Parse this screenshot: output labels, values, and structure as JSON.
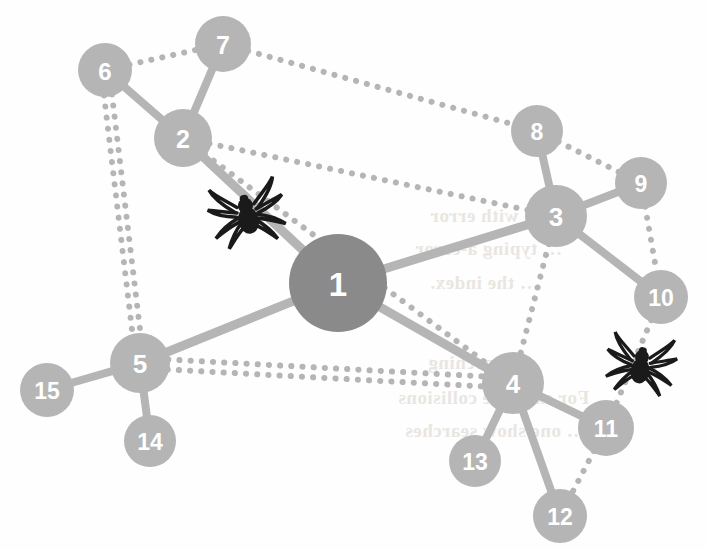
{
  "figure": {
    "type": "network-graph",
    "background_color": "#fefefe",
    "hub_node_color": "#8a8a8a",
    "node_color": "#b5b5b5",
    "edge_color": "#b5b5b5",
    "label_color": "#ffffff",
    "spider_color": "#1a1a1a"
  },
  "nodes": [
    {
      "id": "1",
      "label": "1",
      "x": 338,
      "y": 283,
      "r": 49,
      "kind": "hub",
      "color": "#8a8a8a",
      "font_size": 33
    },
    {
      "id": "2",
      "label": "2",
      "x": 183,
      "y": 138,
      "r": 29,
      "kind": "node",
      "color": "#b5b5b5",
      "font_size": 25
    },
    {
      "id": "3",
      "label": "3",
      "x": 556,
      "y": 216,
      "r": 31,
      "kind": "node",
      "color": "#b5b5b5",
      "font_size": 26
    },
    {
      "id": "4",
      "label": "4",
      "x": 513,
      "y": 383,
      "r": 31,
      "kind": "node",
      "color": "#b5b5b5",
      "font_size": 26
    },
    {
      "id": "5",
      "label": "5",
      "x": 140,
      "y": 363,
      "r": 30,
      "kind": "node",
      "color": "#b5b5b5",
      "font_size": 26
    },
    {
      "id": "6",
      "label": "6",
      "x": 105,
      "y": 70,
      "r": 27,
      "kind": "node",
      "color": "#b5b5b5",
      "font_size": 24
    },
    {
      "id": "7",
      "label": "7",
      "x": 223,
      "y": 44,
      "r": 28,
      "kind": "node",
      "color": "#b5b5b5",
      "font_size": 25
    },
    {
      "id": "8",
      "label": "8",
      "x": 537,
      "y": 131,
      "r": 26,
      "kind": "node",
      "color": "#b5b5b5",
      "font_size": 23
    },
    {
      "id": "9",
      "label": "9",
      "x": 641,
      "y": 183,
      "r": 26,
      "kind": "node",
      "color": "#b5b5b5",
      "font_size": 23
    },
    {
      "id": "10",
      "label": "10",
      "x": 661,
      "y": 297,
      "r": 27,
      "kind": "node",
      "color": "#b5b5b5",
      "font_size": 23
    },
    {
      "id": "11",
      "label": "11",
      "x": 606,
      "y": 428,
      "r": 28,
      "kind": "node",
      "color": "#b5b5b5",
      "font_size": 23
    },
    {
      "id": "12",
      "label": "12",
      "x": 560,
      "y": 516,
      "r": 27,
      "kind": "node",
      "color": "#b5b5b5",
      "font_size": 23
    },
    {
      "id": "13",
      "label": "13",
      "x": 475,
      "y": 461,
      "r": 26,
      "kind": "node",
      "color": "#b5b5b5",
      "font_size": 23
    },
    {
      "id": "14",
      "label": "14",
      "x": 150,
      "y": 441,
      "r": 26,
      "kind": "node",
      "color": "#b5b5b5",
      "font_size": 23
    },
    {
      "id": "15",
      "label": "15",
      "x": 47,
      "y": 390,
      "r": 27,
      "kind": "node",
      "color": "#b5b5b5",
      "font_size": 23
    }
  ],
  "edges": [
    {
      "source": "1",
      "target": "2",
      "style": "solid",
      "width": 9
    },
    {
      "source": "1",
      "target": "3",
      "style": "solid",
      "width": 9
    },
    {
      "source": "1",
      "target": "4",
      "style": "solid",
      "width": 9
    },
    {
      "source": "1",
      "target": "5",
      "style": "solid",
      "width": 9
    },
    {
      "source": "2",
      "target": "6",
      "style": "solid",
      "width": 8
    },
    {
      "source": "2",
      "target": "7",
      "style": "solid",
      "width": 8
    },
    {
      "source": "3",
      "target": "8",
      "style": "solid",
      "width": 8
    },
    {
      "source": "3",
      "target": "9",
      "style": "solid",
      "width": 8
    },
    {
      "source": "3",
      "target": "10",
      "style": "solid",
      "width": 8
    },
    {
      "source": "4",
      "target": "11",
      "style": "solid",
      "width": 8
    },
    {
      "source": "4",
      "target": "12",
      "style": "solid",
      "width": 8
    },
    {
      "source": "4",
      "target": "13",
      "style": "solid",
      "width": 8
    },
    {
      "source": "5",
      "target": "14",
      "style": "solid",
      "width": 8
    },
    {
      "source": "5",
      "target": "15",
      "style": "solid",
      "width": 8
    },
    {
      "source": "6",
      "target": "7",
      "style": "dotted",
      "width": 6
    },
    {
      "source": "6",
      "target": "5",
      "style": "dotted",
      "width": 6,
      "offset": -4
    },
    {
      "source": "6",
      "target": "5",
      "style": "dotted",
      "width": 6,
      "offset": 4
    },
    {
      "source": "7",
      "target": "8",
      "style": "dotted",
      "width": 6
    },
    {
      "source": "2",
      "target": "3",
      "style": "dotted",
      "width": 6
    },
    {
      "source": "2",
      "target": "4",
      "style": "dotted",
      "width": 6
    },
    {
      "source": "5",
      "target": "4",
      "style": "dotted",
      "width": 6,
      "offset": -5
    },
    {
      "source": "5",
      "target": "4",
      "style": "dotted",
      "width": 6,
      "offset": 5
    },
    {
      "source": "3",
      "target": "4",
      "style": "dotted",
      "width": 6
    },
    {
      "source": "8",
      "target": "9",
      "style": "dotted",
      "width": 6
    },
    {
      "source": "9",
      "target": "10",
      "style": "dotted",
      "width": 6
    },
    {
      "source": "10",
      "target": "11",
      "style": "dotted",
      "width": 6
    },
    {
      "source": "11",
      "target": "12",
      "style": "dotted",
      "width": 6
    }
  ],
  "spiders": [
    {
      "name": "spider-on-edge-2-1",
      "x": 247,
      "y": 213,
      "size": 54,
      "rotation": -12,
      "on_edge": "1-2"
    },
    {
      "name": "spider-on-edge-10-11",
      "x": 641,
      "y": 364,
      "size": 50,
      "rotation": 8,
      "on_edge": "10-11"
    }
  ],
  "background_bleed_text": [
    {
      "text": "… … with error",
      "x": 430,
      "y": 205,
      "size": 19
    },
    {
      "text": "… typing a-error",
      "x": 415,
      "y": 238,
      "size": 19
    },
    {
      "text": "… the index.",
      "x": 430,
      "y": 272,
      "size": 19
    },
    {
      "text": "ry searching",
      "x": 428,
      "y": 352,
      "size": 19
    },
    {
      "text": "For example collisions",
      "x": 398,
      "y": 387,
      "size": 19
    },
    {
      "text": "… one show searches",
      "x": 405,
      "y": 420,
      "size": 19
    }
  ]
}
